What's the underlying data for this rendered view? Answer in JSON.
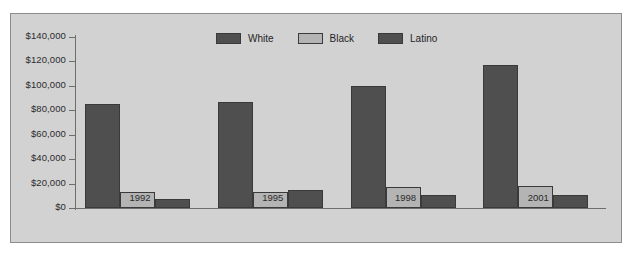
{
  "chart_data": {
    "type": "bar",
    "title": "",
    "subtitle": "",
    "xlabel": "",
    "ylabel": "",
    "categories": [
      "1992",
      "1995",
      "1998",
      "2001"
    ],
    "series": [
      {
        "name": "White",
        "color": "#4f4f4f",
        "values": [
          85000,
          87000,
          100000,
          117000
        ]
      },
      {
        "name": "Black",
        "color": "#b4b4b4",
        "values": [
          13000,
          13500,
          17000,
          18000
        ]
      },
      {
        "name": "Latino",
        "color": "#4f4f4f",
        "values": [
          7500,
          14500,
          10500,
          11000
        ]
      }
    ],
    "ylim": [
      0,
      140000
    ],
    "ytick_values": [
      140000,
      120000,
      100000,
      80000,
      60000,
      40000,
      20000,
      0
    ],
    "ytick_labels": [
      "$140,000",
      "$120,000",
      "$100,000",
      "$80,000",
      "$60,000",
      "$40,000",
      "$20,000",
      "$0"
    ],
    "grid": false,
    "legend_position": "top-center",
    "legend": [
      "White",
      "Black",
      "Latino"
    ],
    "background_color": "#d2d2d2",
    "axis_color": "#6e6e6e",
    "bar_border_color": "#3a3a3a"
  }
}
